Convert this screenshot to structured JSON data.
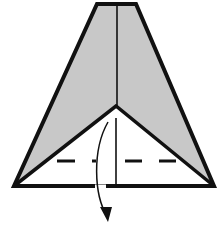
{
  "diagram": {
    "type": "origami-fold-step",
    "colors": {
      "paper_shaded": "#c8c8c8",
      "paper_white": "#ffffff",
      "outline": "#111111"
    },
    "shapes": {
      "outer_outline": "97,4 136,4 214,186 14,186",
      "inner_flap": "14,186 116,106 214,186",
      "center_crease_top": [
        117,
        5,
        117,
        106
      ],
      "center_crease_bottom": [
        116,
        118,
        116,
        188
      ],
      "valley_fold_y": 161,
      "fold_arrow": "M108,122 C92,150 94,195 107,216"
    },
    "annotations": {
      "fold_line_style": "dashed (valley fold)",
      "arrow_direction": "down"
    }
  }
}
